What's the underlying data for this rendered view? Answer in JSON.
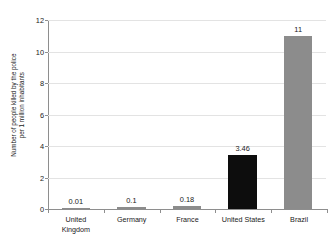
{
  "chart_data": {
    "type": "bar",
    "title": "",
    "subtitle": "",
    "xlabel": "",
    "ylabel": "Number of people killed by the police per 1 million inhabitants",
    "ylabel_lines": [
      "Number of people killed by the police",
      "per 1 million inhabitants"
    ],
    "categories": [
      "United Kingdom",
      "Germany",
      "France",
      "United States",
      "Brazil"
    ],
    "category_lines": [
      [
        "United",
        "Kingdom"
      ],
      [
        "Germany"
      ],
      [
        "France"
      ],
      [
        "United States"
      ],
      [
        "Brazil"
      ]
    ],
    "values": [
      0.01,
      0.1,
      0.18,
      3.46,
      11
    ],
    "value_labels": [
      "0.01",
      "0.1",
      "0.18",
      "3.46",
      "11"
    ],
    "bar_colors": [
      "#8c8c8c",
      "#8c8c8c",
      "#8c8c8c",
      "#8c8c8c",
      "#0d0d0d",
      "#8c8c8c"
    ],
    "highlight_index": 3,
    "highlight_color": "#0d0d0d",
    "default_bar_color": "#8c8c8c",
    "ylim": [
      0,
      12
    ],
    "yticks": [
      0,
      2,
      4,
      6,
      8,
      10,
      12
    ],
    "ytick_labels": [
      "0",
      "2",
      "4",
      "6",
      "8",
      "10",
      "12"
    ],
    "grid": true,
    "grid_color": "#e3e3e3",
    "axis_color": "#8e8e8e",
    "legend": null,
    "background": "#ffffff"
  }
}
